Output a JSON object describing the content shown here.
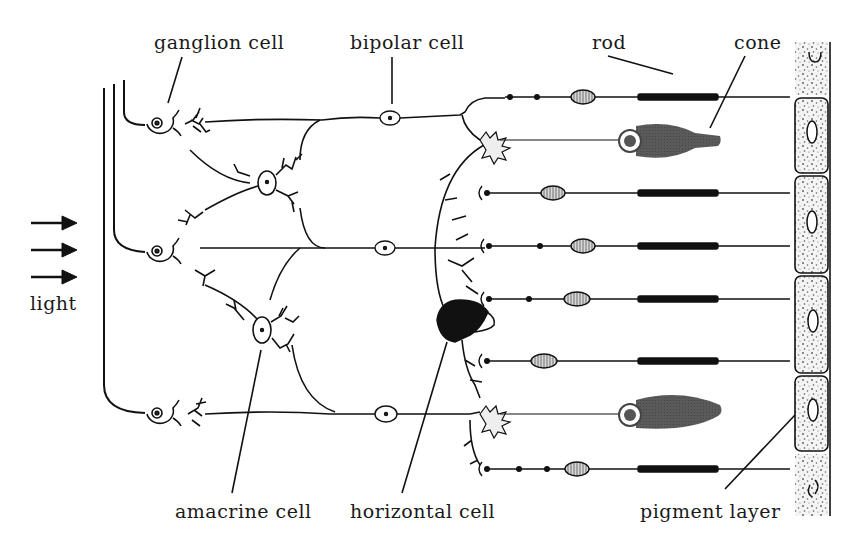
{
  "diagram": {
    "light_direction": "left-to-right",
    "labels": {
      "ganglion": "ganglion cell",
      "bipolar": "bipolar cell",
      "rod": "rod",
      "cone": "cone",
      "light": "light",
      "amacrine": "amacrine cell",
      "horizontal": "horizontal cell",
      "pigment": "pigment layer"
    },
    "colors": {
      "ink": "#1a1a1a",
      "cone_fill": "#555555",
      "pigment_fill": "#f2f2f2",
      "background": "#ffffff"
    },
    "counts": {
      "ganglion_cells": 3,
      "bipolar_cells": 3,
      "amacrine_cells": 2,
      "horizontal_cells": 1,
      "rods": 6,
      "cones": 2,
      "pigment_cells": 6,
      "light_arrows": 3
    }
  }
}
